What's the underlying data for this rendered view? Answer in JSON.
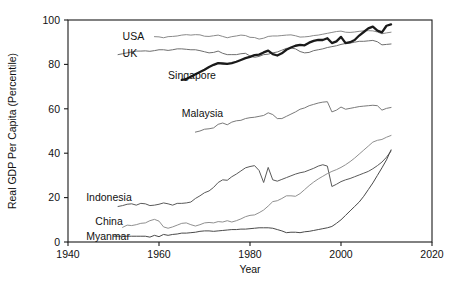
{
  "chart_data": {
    "type": "line",
    "title": "",
    "xlabel": "Year",
    "ylabel": "Real GDP Per Capita (Percentile)",
    "xlim": [
      1940,
      2020
    ],
    "ylim": [
      0,
      100
    ],
    "xticks": [
      1940,
      1960,
      1980,
      2000,
      2020
    ],
    "yticks": [
      0,
      20,
      40,
      60,
      80,
      100
    ],
    "grid": false,
    "legend_position": "inline-labels",
    "series": [
      {
        "name": "USA",
        "color": "#8a8a8a",
        "width": 1.0,
        "label_x": 1952,
        "label_y": 92.5,
        "x": [
          1959,
          1960,
          1961,
          1962,
          1963,
          1964,
          1965,
          1966,
          1967,
          1968,
          1969,
          1970,
          1971,
          1972,
          1973,
          1974,
          1975,
          1976,
          1977,
          1978,
          1979,
          1980,
          1981,
          1982,
          1983,
          1984,
          1985,
          1986,
          1987,
          1988,
          1989,
          1990,
          1991,
          1992,
          1993,
          1994,
          1995,
          1996,
          1997,
          1998,
          1999,
          2000,
          2001,
          2002,
          2003,
          2004,
          2005,
          2006,
          2007,
          2008,
          2009,
          2010,
          2011
        ],
        "values": [
          92.5,
          92.4,
          92.0,
          92.5,
          92.6,
          92.8,
          93.2,
          93.4,
          93.2,
          93.4,
          93.3,
          92.7,
          92.6,
          92.9,
          93.2,
          92.6,
          92.0,
          92.5,
          92.8,
          93.2,
          93.0,
          92.2,
          92.1,
          91.4,
          91.8,
          92.6,
          92.8,
          92.8,
          93.0,
          93.2,
          93.3,
          92.9,
          92.3,
          92.4,
          92.6,
          93.0,
          93.2,
          93.6,
          94.0,
          94.4,
          94.8,
          95.0,
          94.5,
          94.4,
          94.6,
          94.9,
          95.1,
          95.2,
          95.1,
          94.6,
          93.8,
          94.2,
          94.5
        ]
      },
      {
        "name": "UK",
        "color": "#6e6e6e",
        "width": 1.0,
        "label_x": 1952,
        "label_y": 85.0,
        "x": [
          1951,
          1952,
          1953,
          1954,
          1955,
          1956,
          1957,
          1958,
          1959,
          1960,
          1961,
          1962,
          1963,
          1964,
          1965,
          1966,
          1967,
          1968,
          1969,
          1970,
          1971,
          1972,
          1973,
          1974,
          1975,
          1976,
          1977,
          1978,
          1979,
          1980,
          1981,
          1982,
          1983,
          1984,
          1985,
          1986,
          1987,
          1988,
          1989,
          1990,
          1991,
          1992,
          1993,
          1994,
          1995,
          1996,
          1997,
          1998,
          1999,
          2000,
          2001,
          2002,
          2003,
          2004,
          2005,
          2006,
          2007,
          2008,
          2009,
          2010,
          2011
        ],
        "values": [
          84.4,
          84.8,
          85.2,
          85.6,
          86.0,
          86.0,
          86.1,
          85.9,
          86.2,
          86.6,
          86.6,
          86.3,
          86.6,
          87.0,
          87.0,
          86.8,
          86.6,
          86.6,
          86.2,
          85.7,
          85.2,
          85.4,
          86.0,
          85.0,
          84.4,
          84.4,
          84.4,
          84.8,
          85.0,
          83.8,
          83.2,
          83.6,
          84.4,
          84.6,
          85.2,
          85.6,
          86.4,
          87.2,
          87.4,
          87.0,
          85.8,
          85.2,
          85.4,
          86.2,
          86.6,
          87.0,
          87.6,
          88.0,
          88.4,
          89.0,
          89.4,
          89.6,
          90.0,
          90.4,
          90.4,
          90.6,
          90.8,
          90.2,
          88.8,
          89.0,
          89.2
        ]
      },
      {
        "name": "Singapore",
        "color": "#1a1a1a",
        "width": 2.3,
        "label_x": 1962,
        "label_y": 75.0,
        "x": [
          1965,
          1966,
          1967,
          1968,
          1969,
          1970,
          1971,
          1972,
          1973,
          1974,
          1975,
          1976,
          1977,
          1978,
          1979,
          1980,
          1981,
          1982,
          1983,
          1984,
          1985,
          1986,
          1987,
          1988,
          1989,
          1990,
          1991,
          1992,
          1993,
          1994,
          1995,
          1996,
          1997,
          1998,
          1999,
          2000,
          2001,
          2002,
          2003,
          2004,
          2005,
          2006,
          2007,
          2008,
          2009,
          2010,
          2011
        ],
        "values": [
          73.0,
          73.4,
          74.4,
          75.6,
          76.6,
          77.6,
          78.8,
          79.8,
          80.6,
          80.4,
          80.2,
          80.6,
          81.2,
          82.0,
          82.8,
          83.4,
          84.2,
          84.4,
          85.4,
          86.2,
          84.6,
          84.0,
          85.0,
          86.6,
          87.6,
          88.4,
          88.8,
          88.6,
          89.8,
          90.6,
          91.0,
          91.0,
          91.8,
          89.6,
          90.4,
          92.4,
          89.6,
          90.0,
          91.0,
          93.0,
          94.6,
          96.2,
          97.0,
          95.2,
          94.4,
          97.4,
          98.0
        ]
      },
      {
        "name": "Malaysia",
        "color": "#7a7a7a",
        "width": 1.0,
        "label_x": 1965,
        "label_y": 58.0,
        "x": [
          1968,
          1969,
          1970,
          1971,
          1972,
          1973,
          1974,
          1975,
          1976,
          1977,
          1978,
          1979,
          1980,
          1981,
          1982,
          1983,
          1984,
          1985,
          1986,
          1987,
          1988,
          1989,
          1990,
          1991,
          1992,
          1993,
          1994,
          1995,
          1996,
          1997,
          1998,
          1999,
          2000,
          2001,
          2002,
          2003,
          2004,
          2005,
          2006,
          2007,
          2008,
          2009,
          2010,
          2011
        ],
        "values": [
          49.5,
          50.0,
          50.8,
          51.0,
          51.4,
          53.0,
          53.6,
          52.8,
          54.0,
          54.6,
          54.8,
          55.6,
          56.0,
          56.2,
          56.6,
          57.0,
          58.2,
          57.4,
          55.6,
          55.6,
          56.6,
          57.6,
          58.6,
          59.8,
          60.4,
          61.4,
          62.0,
          62.6,
          63.0,
          63.2,
          58.6,
          59.4,
          60.8,
          59.8,
          60.2,
          60.6,
          61.0,
          61.2,
          61.4,
          61.6,
          61.4,
          59.4,
          60.2,
          60.6
        ]
      },
      {
        "name": "Indonesia",
        "color": "#5a5a5a",
        "width": 1.0,
        "label_x": 1944,
        "label_y": 20.0,
        "x": [
          1951,
          1952,
          1953,
          1954,
          1955,
          1956,
          1957,
          1958,
          1959,
          1960,
          1961,
          1962,
          1963,
          1964,
          1965,
          1966,
          1967,
          1968,
          1969,
          1970,
          1971,
          1972,
          1973,
          1974,
          1975,
          1976,
          1977,
          1978,
          1979,
          1980,
          1981,
          1982,
          1983,
          1984,
          1985,
          1986,
          1987,
          1988,
          1989,
          1990,
          1991,
          1992,
          1993,
          1994,
          1995,
          1996,
          1997,
          1998,
          1999,
          2000,
          2001,
          2002,
          2003,
          2004,
          2005,
          2006,
          2007,
          2008,
          2009,
          2010,
          2011
        ],
        "values": [
          16.0,
          16.4,
          17.0,
          17.2,
          16.6,
          17.4,
          17.2,
          16.4,
          16.6,
          17.0,
          17.6,
          17.2,
          16.6,
          17.4,
          17.4,
          17.6,
          18.0,
          19.6,
          20.8,
          22.2,
          23.0,
          24.6,
          26.8,
          28.0,
          27.8,
          29.4,
          30.6,
          32.0,
          33.4,
          34.0,
          34.4,
          32.2,
          26.8,
          33.6,
          28.0,
          27.4,
          28.2,
          29.0,
          29.8,
          30.6,
          31.2,
          31.6,
          32.4,
          33.2,
          34.2,
          34.8,
          34.2,
          25.0,
          26.0,
          27.2,
          28.0,
          28.6,
          29.4,
          30.2,
          31.0,
          31.8,
          33.0,
          34.4,
          36.0,
          38.2,
          41.0
        ]
      },
      {
        "name": "China",
        "color": "#909090",
        "width": 1.0,
        "label_x": 1946,
        "label_y": 9.5,
        "x": [
          1952,
          1953,
          1954,
          1955,
          1956,
          1957,
          1958,
          1959,
          1960,
          1961,
          1962,
          1963,
          1964,
          1965,
          1966,
          1967,
          1968,
          1969,
          1970,
          1971,
          1972,
          1973,
          1974,
          1975,
          1976,
          1977,
          1978,
          1979,
          1980,
          1981,
          1982,
          1983,
          1984,
          1985,
          1986,
          1987,
          1988,
          1989,
          1990,
          1991,
          1992,
          1993,
          1994,
          1995,
          1996,
          1997,
          1998,
          1999,
          2000,
          2001,
          2002,
          2003,
          2004,
          2005,
          2006,
          2007,
          2008,
          2009,
          2010,
          2011
        ],
        "values": [
          6.6,
          7.6,
          7.4,
          7.8,
          8.4,
          8.6,
          9.6,
          10.2,
          9.4,
          6.8,
          6.2,
          6.8,
          7.6,
          8.4,
          8.6,
          7.8,
          7.2,
          7.8,
          8.6,
          8.8,
          8.6,
          9.2,
          9.0,
          9.6,
          9.0,
          9.6,
          10.4,
          11.4,
          12.0,
          12.2,
          13.2,
          14.4,
          16.2,
          18.2,
          18.6,
          19.6,
          20.8,
          20.8,
          20.6,
          21.8,
          23.6,
          25.4,
          27.0,
          28.4,
          29.6,
          30.8,
          31.8,
          32.6,
          33.6,
          34.8,
          36.2,
          37.8,
          39.6,
          41.4,
          43.2,
          45.0,
          45.8,
          46.2,
          47.2,
          48.0
        ]
      },
      {
        "name": "Myanmar",
        "color": "#4a4a4a",
        "width": 1.0,
        "label_x": 1944,
        "label_y": 2.5,
        "x": [
          1950,
          1951,
          1952,
          1953,
          1954,
          1955,
          1956,
          1957,
          1958,
          1959,
          1960,
          1961,
          1962,
          1963,
          1964,
          1965,
          1966,
          1967,
          1968,
          1969,
          1970,
          1971,
          1972,
          1973,
          1974,
          1975,
          1976,
          1977,
          1978,
          1979,
          1980,
          1981,
          1982,
          1983,
          1984,
          1985,
          1986,
          1987,
          1988,
          1989,
          1990,
          1991,
          1992,
          1993,
          1994,
          1995,
          1996,
          1997,
          1998,
          1999,
          2000,
          2001,
          2002,
          2003,
          2004,
          2005,
          2006,
          2007,
          2008,
          2009,
          2010,
          2011
        ],
        "values": [
          2.6,
          2.6,
          2.6,
          2.6,
          2.6,
          2.6,
          2.6,
          2.6,
          2.2,
          3.0,
          2.4,
          3.4,
          3.0,
          3.4,
          3.6,
          4.0,
          4.0,
          4.2,
          4.4,
          4.8,
          5.0,
          5.0,
          4.8,
          5.0,
          5.2,
          5.4,
          5.6,
          5.6,
          5.8,
          5.8,
          6.0,
          6.2,
          6.4,
          6.4,
          6.4,
          6.2,
          5.6,
          5.0,
          4.2,
          4.4,
          4.4,
          4.2,
          4.6,
          4.8,
          5.2,
          5.6,
          6.0,
          6.4,
          7.0,
          8.4,
          10.0,
          12.0,
          14.0,
          16.0,
          18.0,
          20.6,
          23.6,
          26.6,
          30.0,
          33.4,
          37.0,
          41.5
        ]
      }
    ]
  }
}
